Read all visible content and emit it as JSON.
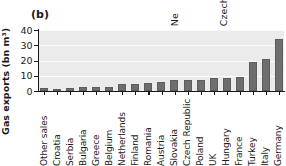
{
  "panel": {
    "letter": "(b)"
  },
  "clipped_labels_above": [
    {
      "text": "Ne",
      "left": 170
    },
    {
      "text": "Czech",
      "left": 219
    }
  ],
  "chart_data": {
    "type": "bar",
    "title": "(b)",
    "xlabel": "",
    "ylabel": "Gas exports (bn m3)",
    "ylabel_display": "Gas exports (bn m³)",
    "ylim": [
      0,
      40
    ],
    "yticks": [
      0,
      10,
      20,
      30,
      40
    ],
    "grid": true,
    "legend": "none",
    "bar_color": "#6e6e6e",
    "plot_background": "#ebebeb",
    "categories": [
      "Other sales",
      "Croatia",
      "Serbia",
      "Bulgaria",
      "Greece",
      "Belgium",
      "Netherlands",
      "Finland",
      "Romania",
      "Austria",
      "Slovakia",
      "Czech Republic",
      "Poland",
      "UK",
      "Hungary",
      "France",
      "Turkey",
      "Italy",
      "Germany"
    ],
    "values": [
      1.8,
      0.5,
      1.9,
      2.4,
      2.5,
      2.7,
      4.3,
      4.4,
      5.2,
      6.1,
      6.9,
      7.0,
      7.5,
      8.4,
      8.6,
      9.3,
      19.2,
      21.3,
      34.0
    ]
  }
}
